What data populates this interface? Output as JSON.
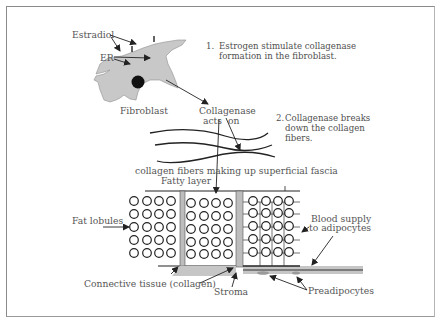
{
  "diagram": {
    "labels": {
      "estradiol": "Estradiol",
      "er": "ER",
      "fibroblast": "Fibroblast",
      "collagenase_line1": "Collagenase",
      "collagenase_line2_a": "acts",
      "collagenase_line2_b": "on",
      "fibers": "collagen fibers making up superficial fascia",
      "fatty_layer": "Fatty layer",
      "fat_lobules": "Fat lobules",
      "blood_supply_line1": "Blood supply",
      "blood_supply_line2": "to adipocytes",
      "connective_tissue": "Connective tissue (collagen)",
      "stroma": "Stroma",
      "preadipocytes": "Preadipocytes"
    },
    "steps": [
      {
        "number": "1.",
        "line1": "Estrogen stimulate collagenase",
        "line2": "formation in the fibroblast."
      },
      {
        "number": "2.",
        "line1": "Collagenase breaks",
        "line2": "down the collagen",
        "line3": "fibers."
      }
    ],
    "colors": {
      "cell_fill": "#c8c8c8",
      "nucleus": "#111111",
      "stroke": "#222222",
      "septum_fill": "#bdbdbd",
      "text": "#555555",
      "frame": "#8a8a8a"
    }
  }
}
